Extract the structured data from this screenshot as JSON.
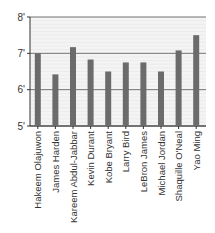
{
  "chart_data": {
    "type": "bar",
    "title": "",
    "xlabel": "",
    "ylabel": "",
    "categories": [
      "Hakeem Olajuwon",
      "James Harden",
      "Kareem Abdul-Jabbar",
      "Kevin Durant",
      "Kobe Bryant",
      "Larry Bird",
      "LeBron James",
      "Michael Jordan",
      "Shaquille O'Neal",
      "Yao Ming"
    ],
    "values": [
      7.0,
      6.42,
      7.17,
      6.83,
      6.5,
      6.75,
      6.75,
      6.5,
      7.08,
      7.5
    ],
    "ylim": [
      5,
      8
    ],
    "yticks": [
      5,
      6,
      7,
      8
    ],
    "ytick_labels": [
      "5'",
      "6'",
      "7'",
      "8'"
    ],
    "grid": true,
    "bar_color": "#6b6b6b",
    "legend": null
  }
}
